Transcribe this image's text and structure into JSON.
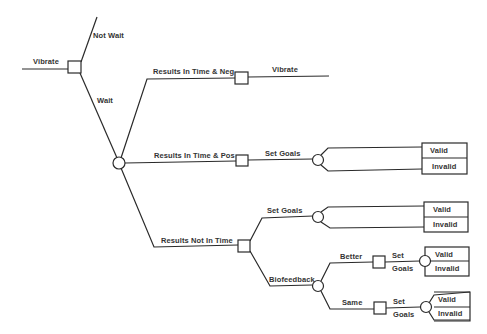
{
  "diagram": {
    "type": "decision-tree",
    "colors": {
      "line": "#2a2a2a",
      "text": "#333333",
      "background": "#ffffff"
    },
    "root": {
      "incoming_label": "Vibrate",
      "node": "decision",
      "branches": {
        "not_wait": "Not Wait",
        "wait": "Wait"
      }
    },
    "chance_wait": {
      "node": "chance",
      "branches": {
        "neg": "Results In Time & Neg",
        "pos": "Results In Time & Pos",
        "not_in_time": "Results Not In Time"
      }
    },
    "neg_decision": {
      "node": "decision",
      "action": "Vibrate"
    },
    "pos_decision": {
      "node": "decision",
      "action": "Set Goals",
      "outcomes": [
        "Valid",
        "Invalid"
      ]
    },
    "not_in_time_decision": {
      "node": "decision",
      "set_goals": {
        "label": "Set Goals",
        "outcomes": [
          "Valid",
          "Invalid"
        ]
      },
      "biofeedback": {
        "label": "Biofeedback",
        "node": "chance",
        "better": {
          "label": "Better",
          "action_line1": "Set",
          "action_line2": "Goals",
          "outcomes": [
            "Valid",
            "Invalid"
          ]
        },
        "same": {
          "label": "Same",
          "action_line1": "Set",
          "action_line2": "Goals",
          "outcomes": [
            "Valid",
            "Invalid"
          ]
        }
      }
    }
  }
}
